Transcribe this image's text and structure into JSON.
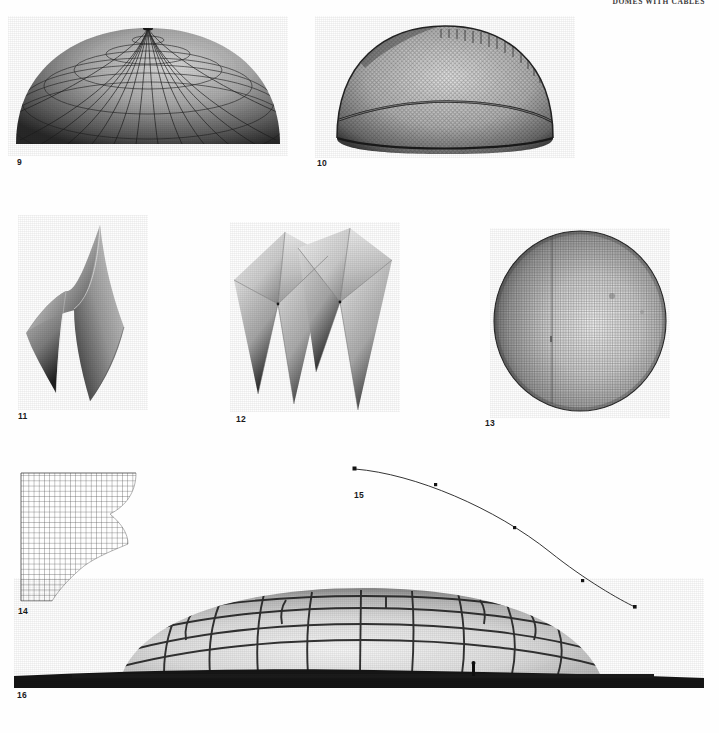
{
  "page": {
    "running_head": "DOMES WITH CABLES",
    "background_color": "#fefefe",
    "width": 719,
    "height": 733
  },
  "figures": [
    {
      "number": "9",
      "caption_number": "9",
      "subject": "shallow ribbed dome model",
      "description": "Low-rise dome shell with radial meridian ribs and concentric ring purlins, photographed from slightly above the springing line.",
      "kind": "photograph",
      "tone": "grayscale halftone",
      "num_meridians": 28,
      "num_rings": 8
    },
    {
      "number": "10",
      "caption_number": "10",
      "subject": "hemispherical mesh lattice dome model",
      "description": "Hemispherical wire-mesh dome model with a pronounced circumferential cable ring near mid-height and a fine diagonal grid fabric.",
      "kind": "photograph",
      "tone": "grayscale halftone",
      "mesh_density": "fine diagonal"
    },
    {
      "number": "11",
      "caption_number": "11",
      "subject": "hyperbolic paraboloid saddle shell pair",
      "description": "Two interlocking warped hypar shell surfaces rising to sharp points, shown in raking light.",
      "kind": "photograph",
      "tone": "grayscale halftone"
    },
    {
      "number": "12",
      "caption_number": "12",
      "subject": "grouped rhombic hypar shells",
      "description": "Two clusters of four rhombic hyperbolic paraboloid panels meeting at central low points, forming a folded umbrella roof.",
      "kind": "photograph",
      "tone": "grayscale halftone"
    },
    {
      "number": "13",
      "caption_number": "13",
      "subject": "spherical net structure",
      "description": "Nearly full sphere formed from a fine square-mesh net, lit from the right so a highlight falls across the centre.",
      "kind": "photograph",
      "tone": "grayscale halftone"
    },
    {
      "number": "14",
      "caption_number": "14",
      "subject": "quarter plan of cable net grid",
      "description": "Line drawing of a quadrant of an orthogonal cable net, the outer boundary stepping in a concave curve.",
      "kind": "line drawing",
      "grid_cells_x": 22,
      "grid_cells_y": 22
    },
    {
      "number": "15",
      "caption_number": "15",
      "subject": "funicular cable profile",
      "description": "Single thin cable curve descending from upper left to lower right with five measuring nodes marked along its length.",
      "kind": "line drawing",
      "node_count": 5
    },
    {
      "number": "16",
      "caption_number": "16",
      "subject": "large hexagonal panel radome",
      "description": "Wide low geodesic radome clad with hexagonal and pentagonal panels, standing on a dark horizon band with a figure for scale.",
      "kind": "photograph",
      "tone": "grayscale halftone"
    }
  ],
  "colors": {
    "ink": "#111111",
    "paper": "#fefefe",
    "head_gray": "#3b3b3b",
    "plate_dark": "#2b2b2b",
    "plate_mid": "#8d8d8d",
    "plate_light": "#e9e9e9"
  }
}
